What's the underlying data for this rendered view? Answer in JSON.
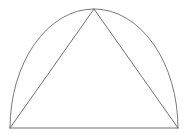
{
  "figure": {
    "canvas": {
      "width": 189,
      "height": 133,
      "background_color": "#ffffff"
    },
    "style": {
      "stroke_color": "#6f6f6f",
      "arc_stroke_color": "#7a7a7a",
      "baseline_stroke_color": "#707070",
      "stroke_width": 1,
      "fill": "none"
    },
    "points": {
      "left_base": {
        "label": "left base vertex",
        "x": 10,
        "y": 128
      },
      "right_base": {
        "label": "right base vertex",
        "x": 178,
        "y": 128
      },
      "apex": {
        "label": "apex",
        "x": 94,
        "y": 9
      }
    },
    "shapes": [
      {
        "name": "arc",
        "kind": "elliptical-arc",
        "description": "dome arc from left base vertex over the apex to right base vertex",
        "d": "M 10 128 A 84 119 0 0 1 178 128",
        "rx": 84,
        "ry": 119,
        "stroke": "#7a7a7a",
        "stroke_width": 1
      },
      {
        "name": "baseline",
        "kind": "line",
        "description": "horizontal chord closing the arc",
        "d": "M 10 128 L 178 128",
        "stroke": "#707070",
        "stroke_width": 1
      },
      {
        "name": "triangle-left-leg",
        "kind": "line",
        "description": "segment from left base vertex to apex",
        "d": "M 10 128 L 94 9",
        "stroke": "#6f6f6f",
        "stroke_width": 1
      },
      {
        "name": "triangle-right-leg",
        "kind": "line",
        "description": "segment from apex to right base vertex",
        "d": "M 94 9 L 178 128",
        "stroke": "#6f6f6f",
        "stroke_width": 1
      }
    ]
  }
}
